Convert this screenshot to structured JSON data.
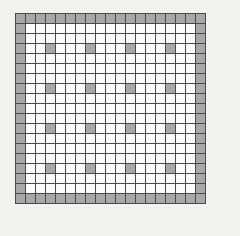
{
  "figure": {
    "name": "lattice-grid",
    "background_color": "#f2f2f0"
  },
  "chart_data": {
    "type": "heatmap",
    "title": "",
    "subtitle": "",
    "xlabel": "",
    "ylabel": "",
    "rows": 19,
    "cols": 19,
    "grid": true,
    "legend": "none",
    "xticklabels": [],
    "yticklabels": [],
    "states": {
      "0": "empty",
      "1": "filled"
    },
    "colors": {
      "empty": "#fbfbfb",
      "filled": "#a8a8a8",
      "gridline": "#4a4a4a",
      "background": "#f2f2f0"
    },
    "cell_size_px": 11,
    "interior_fill_period_rows": 4,
    "interior_fill_period_cols": 4,
    "interior_fill_offset_rows": 3,
    "interior_fill_offset_cols": 3,
    "filled_count": 88,
    "empty_count": 273,
    "values": [
      [
        1,
        1,
        1,
        1,
        1,
        1,
        1,
        1,
        1,
        1,
        1,
        1,
        1,
        1,
        1,
        1,
        1,
        1,
        1
      ],
      [
        1,
        0,
        0,
        0,
        0,
        0,
        0,
        0,
        0,
        0,
        0,
        0,
        0,
        0,
        0,
        0,
        0,
        0,
        1
      ],
      [
        1,
        0,
        0,
        0,
        0,
        0,
        0,
        0,
        0,
        0,
        0,
        0,
        0,
        0,
        0,
        0,
        0,
        0,
        1
      ],
      [
        1,
        0,
        0,
        1,
        0,
        0,
        0,
        1,
        0,
        0,
        0,
        1,
        0,
        0,
        0,
        1,
        0,
        0,
        1
      ],
      [
        1,
        0,
        0,
        0,
        0,
        0,
        0,
        0,
        0,
        0,
        0,
        0,
        0,
        0,
        0,
        0,
        0,
        0,
        1
      ],
      [
        1,
        0,
        0,
        0,
        0,
        0,
        0,
        0,
        0,
        0,
        0,
        0,
        0,
        0,
        0,
        0,
        0,
        0,
        1
      ],
      [
        1,
        0,
        0,
        0,
        0,
        0,
        0,
        0,
        0,
        0,
        0,
        0,
        0,
        0,
        0,
        0,
        0,
        0,
        1
      ],
      [
        1,
        0,
        0,
        1,
        0,
        0,
        0,
        1,
        0,
        0,
        0,
        1,
        0,
        0,
        0,
        1,
        0,
        0,
        1
      ],
      [
        1,
        0,
        0,
        0,
        0,
        0,
        0,
        0,
        0,
        0,
        0,
        0,
        0,
        0,
        0,
        0,
        0,
        0,
        1
      ],
      [
        1,
        0,
        0,
        0,
        0,
        0,
        0,
        0,
        0,
        0,
        0,
        0,
        0,
        0,
        0,
        0,
        0,
        0,
        1
      ],
      [
        1,
        0,
        0,
        0,
        0,
        0,
        0,
        0,
        0,
        0,
        0,
        0,
        0,
        0,
        0,
        0,
        0,
        0,
        1
      ],
      [
        1,
        0,
        0,
        1,
        0,
        0,
        0,
        1,
        0,
        0,
        0,
        1,
        0,
        0,
        0,
        1,
        0,
        0,
        1
      ],
      [
        1,
        0,
        0,
        0,
        0,
        0,
        0,
        0,
        0,
        0,
        0,
        0,
        0,
        0,
        0,
        0,
        0,
        0,
        1
      ],
      [
        1,
        0,
        0,
        0,
        0,
        0,
        0,
        0,
        0,
        0,
        0,
        0,
        0,
        0,
        0,
        0,
        0,
        0,
        1
      ],
      [
        1,
        0,
        0,
        0,
        0,
        0,
        0,
        0,
        0,
        0,
        0,
        0,
        0,
        0,
        0,
        0,
        0,
        0,
        1
      ],
      [
        1,
        0,
        0,
        1,
        0,
        0,
        0,
        1,
        0,
        0,
        0,
        1,
        0,
        0,
        0,
        1,
        0,
        0,
        1
      ],
      [
        1,
        0,
        0,
        0,
        0,
        0,
        0,
        0,
        0,
        0,
        0,
        0,
        0,
        0,
        0,
        0,
        0,
        0,
        1
      ],
      [
        1,
        0,
        0,
        0,
        0,
        0,
        0,
        0,
        0,
        0,
        0,
        0,
        0,
        0,
        0,
        0,
        0,
        0,
        1
      ],
      [
        1,
        1,
        1,
        1,
        1,
        1,
        1,
        1,
        1,
        1,
        1,
        1,
        1,
        1,
        1,
        1,
        1,
        1,
        1
      ]
    ]
  }
}
